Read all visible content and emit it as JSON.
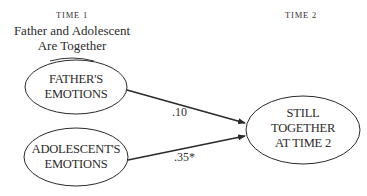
{
  "header": {
    "time1_label": "TIME 1",
    "time1_condition_line1": "Father and Adolescent",
    "time1_condition_line2": "Are Together",
    "time2_label": "TIME 2"
  },
  "nodes": {
    "father": {
      "line1": "FATHER'S",
      "line2": "EMOTIONS"
    },
    "adolescent": {
      "line1": "ADOLESCENT'S",
      "line2": "EMOTIONS"
    },
    "outcome": {
      "line1": "STILL",
      "line2": "TOGETHER",
      "line3": "AT TIME 2"
    }
  },
  "paths": [
    {
      "from": "FATHER'S EMOTIONS",
      "to": "STILL TOGETHER AT TIME 2",
      "coefficient": ".10"
    },
    {
      "from": "ADOLESCENT'S EMOTIONS",
      "to": "STILL TOGETHER AT TIME 2",
      "coefficient": ".35*"
    }
  ],
  "colors": {
    "stroke": "#2a2a2a",
    "background": "#ffffff"
  }
}
